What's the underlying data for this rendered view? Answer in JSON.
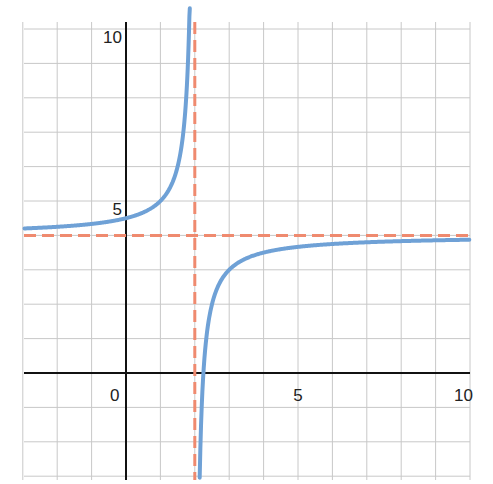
{
  "chart_data": {
    "type": "line",
    "title": "",
    "xlabel": "",
    "ylabel": "",
    "function": "y = 4 - 1/(x - 2)",
    "xlim": [
      -3,
      10
    ],
    "ylim": [
      -3,
      10
    ],
    "grid": true,
    "x_ticks": [
      {
        "value": 0,
        "label": "0"
      },
      {
        "value": 5,
        "label": "5"
      },
      {
        "value": 10,
        "label": "10"
      }
    ],
    "y_ticks": [
      {
        "value": 5,
        "label": "5"
      },
      {
        "value": 10,
        "label": "10"
      }
    ],
    "series": [
      {
        "name": "curve",
        "color": "#6fa1d6",
        "style": "solid",
        "points_left_branch": [
          [
            -3,
            4.2
          ],
          [
            -2,
            4.25
          ],
          [
            -1,
            4.33
          ],
          [
            0,
            4.5
          ],
          [
            1,
            5
          ],
          [
            1.5,
            6
          ],
          [
            1.8,
            9
          ],
          [
            1.85,
            10.67
          ]
        ],
        "points_right_branch": [
          [
            2.14,
            -3
          ],
          [
            2.25,
            0
          ],
          [
            2.5,
            2
          ],
          [
            3,
            3
          ],
          [
            4,
            3.5
          ],
          [
            5,
            3.67
          ],
          [
            6,
            3.75
          ],
          [
            8,
            3.83
          ],
          [
            10,
            3.875
          ]
        ]
      },
      {
        "name": "vertical asymptote",
        "color": "#ef8a6f",
        "style": "dashed",
        "x": 2
      },
      {
        "name": "horizontal asymptote",
        "color": "#ef8a6f",
        "style": "dashed",
        "y": 4
      }
    ]
  },
  "colors": {
    "curve": "#6fa1d6",
    "asymptote": "#ef8a6f",
    "grid": "#c8c8c8",
    "axis": "#111111"
  }
}
